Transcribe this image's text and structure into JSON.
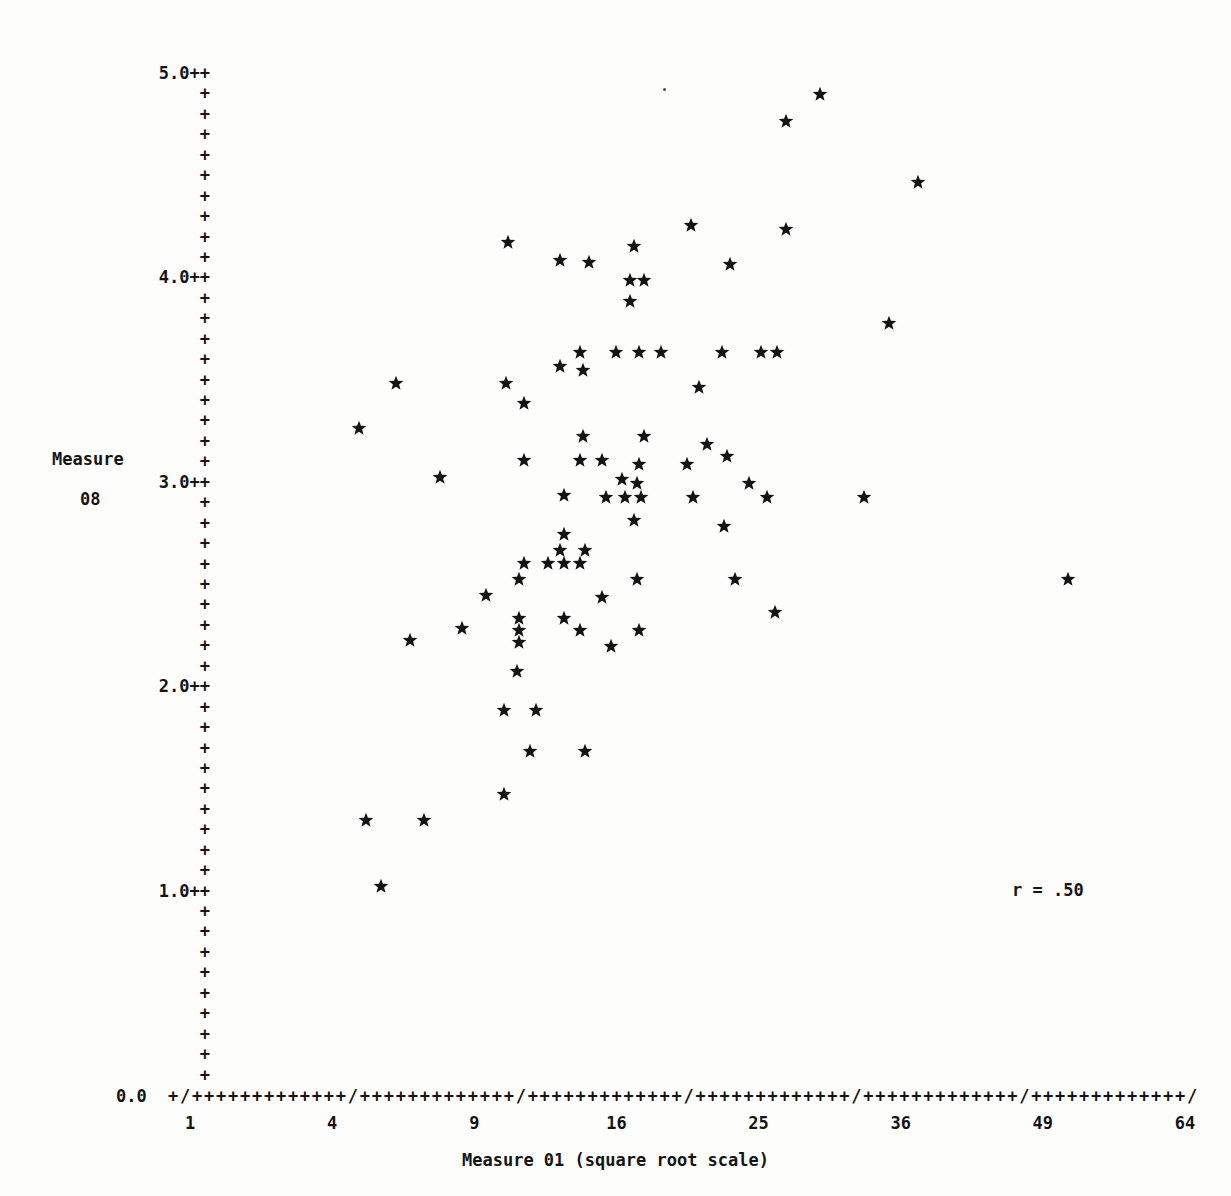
{
  "chart_data": {
    "type": "scatter",
    "title": "",
    "xlabel": "Measure 01 (square root scale)",
    "ylabel": "Measure 08",
    "ylabel_lines": [
      "Measure",
      "08"
    ],
    "annotation": "r = .50",
    "correlation": 0.5,
    "marker_glyph": "star",
    "axis_glyph_x": "+",
    "axis_glyph_y": "+",
    "tick_glyph_x": "/",
    "grid": false,
    "legend": "none",
    "x_scale": "square-root",
    "xlim": [
      1,
      64
    ],
    "ylim": [
      0.0,
      5.0
    ],
    "xticks": [
      1,
      4,
      9,
      16,
      25,
      36,
      49,
      64
    ],
    "xtick_labels": [
      "1",
      "4",
      "9",
      "16",
      "25",
      "36",
      "49",
      "64"
    ],
    "yticks": [
      0.0,
      1.0,
      2.0,
      3.0,
      4.0,
      5.0
    ],
    "ytick_labels": [
      "0.0",
      "1.0++",
      "2.0++",
      "3.0++",
      "4.0++",
      "5.0++"
    ],
    "y_minor_rows_per_unit": 10,
    "x_axis_row_text": "+/+++++++++++++/+++++++++++++/+++++++++++++/+++++++++++++/+++++++++++++/+++++++++++++/",
    "x_zero_label": "0.0",
    "n_points": 118,
    "points": [
      {
        "x": 29.5,
        "y": 4.89
      },
      {
        "x": 27.0,
        "y": 4.76
      },
      {
        "x": 37.5,
        "y": 4.46
      },
      {
        "x": 20.5,
        "y": 4.25
      },
      {
        "x": 27.0,
        "y": 4.23
      },
      {
        "x": 10.5,
        "y": 4.17
      },
      {
        "x": 17.0,
        "y": 4.15
      },
      {
        "x": 13.0,
        "y": 4.08
      },
      {
        "x": 14.5,
        "y": 4.07
      },
      {
        "x": 23.0,
        "y": 4.06
      },
      {
        "x": 16.8,
        "y": 3.98
      },
      {
        "x": 17.6,
        "y": 3.98
      },
      {
        "x": 16.8,
        "y": 3.88
      },
      {
        "x": 35.0,
        "y": 3.77
      },
      {
        "x": 14.0,
        "y": 3.63
      },
      {
        "x": 16.0,
        "y": 3.63
      },
      {
        "x": 17.3,
        "y": 3.63
      },
      {
        "x": 18.6,
        "y": 3.63
      },
      {
        "x": 22.5,
        "y": 3.63
      },
      {
        "x": 25.2,
        "y": 3.63
      },
      {
        "x": 26.3,
        "y": 3.63
      },
      {
        "x": 13.0,
        "y": 3.56
      },
      {
        "x": 14.2,
        "y": 3.54
      },
      {
        "x": 6.0,
        "y": 3.48
      },
      {
        "x": 10.4,
        "y": 3.48
      },
      {
        "x": 21.0,
        "y": 3.46
      },
      {
        "x": 11.2,
        "y": 3.38
      },
      {
        "x": 4.8,
        "y": 3.26
      },
      {
        "x": 14.2,
        "y": 3.22
      },
      {
        "x": 17.6,
        "y": 3.22
      },
      {
        "x": 21.5,
        "y": 3.18
      },
      {
        "x": 22.8,
        "y": 3.12
      },
      {
        "x": 11.2,
        "y": 3.1
      },
      {
        "x": 14.0,
        "y": 3.1
      },
      {
        "x": 15.2,
        "y": 3.1
      },
      {
        "x": 17.3,
        "y": 3.08
      },
      {
        "x": 20.2,
        "y": 3.08
      },
      {
        "x": 7.6,
        "y": 3.02
      },
      {
        "x": 16.3,
        "y": 3.01
      },
      {
        "x": 17.2,
        "y": 2.99
      },
      {
        "x": 24.3,
        "y": 2.99
      },
      {
        "x": 13.2,
        "y": 2.93
      },
      {
        "x": 15.4,
        "y": 2.92
      },
      {
        "x": 16.5,
        "y": 2.92
      },
      {
        "x": 17.4,
        "y": 2.92
      },
      {
        "x": 20.6,
        "y": 2.92
      },
      {
        "x": 25.6,
        "y": 2.92
      },
      {
        "x": 33.0,
        "y": 2.92
      },
      {
        "x": 17.0,
        "y": 2.81
      },
      {
        "x": 22.6,
        "y": 2.78
      },
      {
        "x": 13.2,
        "y": 2.74
      },
      {
        "x": 13.0,
        "y": 2.66
      },
      {
        "x": 14.3,
        "y": 2.66
      },
      {
        "x": 11.2,
        "y": 2.6
      },
      {
        "x": 12.4,
        "y": 2.6
      },
      {
        "x": 13.2,
        "y": 2.6
      },
      {
        "x": 14.0,
        "y": 2.6
      },
      {
        "x": 11.0,
        "y": 2.52
      },
      {
        "x": 17.2,
        "y": 2.52
      },
      {
        "x": 23.4,
        "y": 2.52
      },
      {
        "x": 51.5,
        "y": 2.52
      },
      {
        "x": 9.5,
        "y": 2.44
      },
      {
        "x": 15.2,
        "y": 2.43
      },
      {
        "x": 26.2,
        "y": 2.36
      },
      {
        "x": 11.0,
        "y": 2.33
      },
      {
        "x": 13.2,
        "y": 2.33
      },
      {
        "x": 8.5,
        "y": 2.28
      },
      {
        "x": 11.0,
        "y": 2.27
      },
      {
        "x": 14.0,
        "y": 2.27
      },
      {
        "x": 17.3,
        "y": 2.27
      },
      {
        "x": 6.5,
        "y": 2.22
      },
      {
        "x": 11.0,
        "y": 2.21
      },
      {
        "x": 15.7,
        "y": 2.19
      },
      {
        "x": 10.9,
        "y": 2.07
      },
      {
        "x": 10.3,
        "y": 1.88
      },
      {
        "x": 11.8,
        "y": 1.88
      },
      {
        "x": 11.5,
        "y": 1.68
      },
      {
        "x": 14.3,
        "y": 1.68
      },
      {
        "x": 10.3,
        "y": 1.47
      },
      {
        "x": 5.0,
        "y": 1.34
      },
      {
        "x": 7.0,
        "y": 1.34
      },
      {
        "x": 5.5,
        "y": 1.02
      }
    ]
  },
  "figure": {
    "background": "#fdfdfc",
    "ink_color": "#141414",
    "style": "line-printer ascii plot"
  }
}
